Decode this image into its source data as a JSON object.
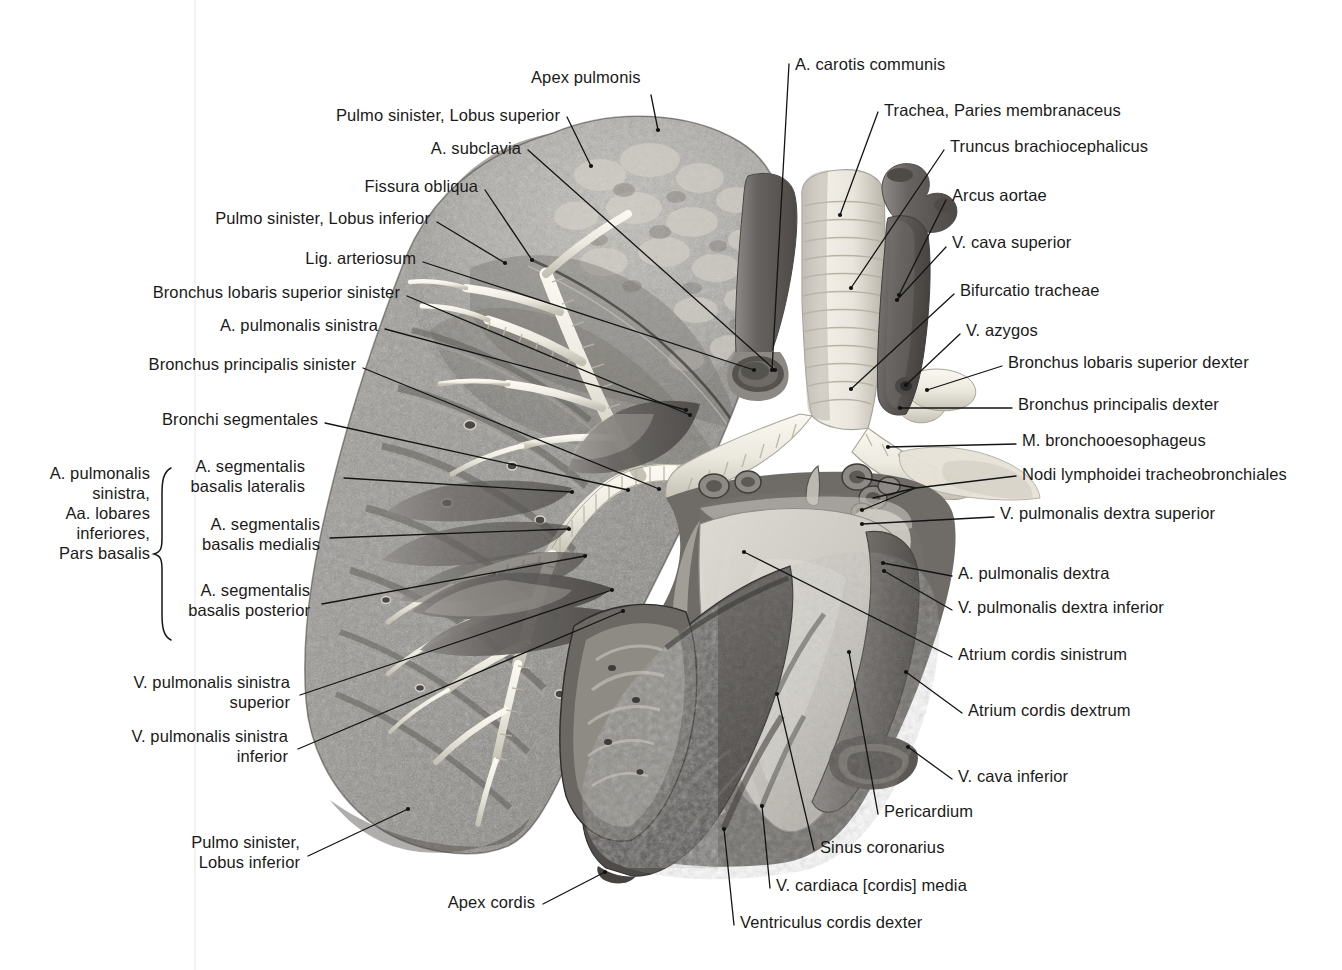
{
  "figure": {
    "type": "anatomical-photograph",
    "orientation": "medial view of left lung with heart and great vessels"
  },
  "colors": {
    "background": "#ffffff",
    "text": "#1a1a1a",
    "leader_line": "#141414",
    "gutter": "#f2f2f4",
    "lung_light": "#b9b6b0",
    "lung_mid": "#8e8b86",
    "lung_dark": "#5e5b57",
    "bronchus_white": "#efece4",
    "vessel_dark": "#6d6a68",
    "atrium_light": "#cfccc6",
    "myocardium": "#5a5754"
  },
  "labels": {
    "left": [
      {
        "id": "pulmo-sinister-lobus-superior",
        "text": "Pulmo sinister, Lobus superior",
        "x": 560,
        "y": 115,
        "align": "right",
        "lines": 1
      },
      {
        "id": "a-subclavia",
        "text": "A. subclavia",
        "x": 521,
        "y": 148,
        "align": "right",
        "lines": 1
      },
      {
        "id": "fissura-obliqua",
        "text": "Fissura obliqua",
        "x": 478,
        "y": 186,
        "align": "right",
        "lines": 1
      },
      {
        "id": "pulmo-sinister-lobus-inferior-top",
        "text": "Pulmo sinister, Lobus inferior",
        "x": 430,
        "y": 218,
        "align": "right",
        "lines": 1
      },
      {
        "id": "lig-arteriosum",
        "text": "Lig. arteriosum",
        "x": 416,
        "y": 258,
        "align": "right",
        "lines": 1
      },
      {
        "id": "bronchus-lobaris-superior-sinister",
        "text": "Bronchus lobaris superior sinister",
        "x": 400,
        "y": 292,
        "align": "right",
        "lines": 1
      },
      {
        "id": "a-pulmonalis-sinistra",
        "text": "A. pulmonalis sinistra",
        "x": 378,
        "y": 325,
        "align": "right",
        "lines": 1
      },
      {
        "id": "bronchus-principalis-sinister",
        "text": "Bronchus principalis sinister",
        "x": 356,
        "y": 364,
        "align": "right",
        "lines": 1
      },
      {
        "id": "bronchi-segmentales",
        "text": "Bronchi segmentales",
        "x": 318,
        "y": 419,
        "align": "right",
        "lines": 1
      },
      {
        "id": "a-segmentalis-basalis-lateralis",
        "text": "A. segmentalis\nbasalis lateralis",
        "x": 305,
        "y": 476,
        "align": "right",
        "lines": 2
      },
      {
        "id": "a-segmentalis-basalis-medialis",
        "text": "A. segmentalis\nbasalis medialis",
        "x": 320,
        "y": 534,
        "align": "right",
        "lines": 2
      },
      {
        "id": "a-segmentalis-basalis-posterior",
        "text": "A. segmentalis\nbasalis posterior",
        "x": 310,
        "y": 600,
        "align": "right",
        "lines": 2
      },
      {
        "id": "v-pulmonalis-sinistra-superior",
        "text": "V. pulmonalis sinistra\nsuperior",
        "x": 290,
        "y": 692,
        "align": "right",
        "lines": 2
      },
      {
        "id": "v-pulmonalis-sinistra-inferior",
        "text": "V. pulmonalis sinistra\ninferior",
        "x": 288,
        "y": 746,
        "align": "right",
        "lines": 2
      },
      {
        "id": "pulmo-sinister-lobus-inferior-bottom",
        "text": "Pulmo sinister,\nLobus inferior",
        "x": 300,
        "y": 852,
        "align": "right",
        "lines": 2
      }
    ],
    "brace_group": {
      "id": "a-pulmonalis-sinistra-group",
      "text": "A. pulmonalis\nsinistra,\nAa. lobares\ninferiores,\nPars basalis",
      "x": 150,
      "y": 513,
      "align": "right",
      "lines": 5,
      "brace": {
        "x": 160,
        "top": 468,
        "bottom": 640
      }
    },
    "right": [
      {
        "id": "a-carotis-communis",
        "text": "A. carotis communis",
        "x": 795,
        "y": 64,
        "align": "left",
        "lines": 1
      },
      {
        "id": "trachea-paries-membranaceus",
        "text": "Trachea, Paries membranaceus",
        "x": 884,
        "y": 110,
        "align": "left",
        "lines": 1
      },
      {
        "id": "truncus-brachiocephalicus",
        "text": "Truncus brachiocephalicus",
        "x": 950,
        "y": 146,
        "align": "left",
        "lines": 1
      },
      {
        "id": "arcus-aortae",
        "text": "Arcus aortae",
        "x": 952,
        "y": 195,
        "align": "left",
        "lines": 1
      },
      {
        "id": "v-cava-superior",
        "text": "V. cava superior",
        "x": 952,
        "y": 242,
        "align": "left",
        "lines": 1
      },
      {
        "id": "bifurcatio-tracheae",
        "text": "Bifurcatio tracheae",
        "x": 960,
        "y": 290,
        "align": "left",
        "lines": 1
      },
      {
        "id": "v-azygos",
        "text": "V. azygos",
        "x": 966,
        "y": 330,
        "align": "left",
        "lines": 1
      },
      {
        "id": "bronchus-lobaris-superior-dexter",
        "text": "Bronchus lobaris superior dexter",
        "x": 1008,
        "y": 362,
        "align": "left",
        "lines": 1
      },
      {
        "id": "bronchus-principalis-dexter",
        "text": "Bronchus principalis dexter",
        "x": 1018,
        "y": 404,
        "align": "left",
        "lines": 1
      },
      {
        "id": "m-bronchooesophageus",
        "text": "M. bronchooesophageus",
        "x": 1022,
        "y": 440,
        "align": "left",
        "lines": 1
      },
      {
        "id": "nodi-lymphoidei-tracheobronchiales",
        "text": "Nodi lymphoidei tracheobronchiales",
        "x": 1022,
        "y": 474,
        "align": "left",
        "lines": 1
      },
      {
        "id": "v-pulmonalis-dextra-superior",
        "text": "V. pulmonalis dextra superior",
        "x": 1000,
        "y": 513,
        "align": "left",
        "lines": 1
      },
      {
        "id": "a-pulmonalis-dextra",
        "text": "A. pulmonalis dextra",
        "x": 958,
        "y": 573,
        "align": "left",
        "lines": 1
      },
      {
        "id": "v-pulmonalis-dextra-inferior",
        "text": "V. pulmonalis dextra inferior",
        "x": 958,
        "y": 607,
        "align": "left",
        "lines": 1
      },
      {
        "id": "atrium-cordis-sinistrum",
        "text": "Atrium cordis sinistrum",
        "x": 958,
        "y": 654,
        "align": "left",
        "lines": 1
      },
      {
        "id": "atrium-cordis-dextrum",
        "text": "Atrium cordis dextrum",
        "x": 968,
        "y": 710,
        "align": "left",
        "lines": 1
      },
      {
        "id": "v-cava-inferior",
        "text": "V. cava inferior",
        "x": 958,
        "y": 776,
        "align": "left",
        "lines": 1
      },
      {
        "id": "pericardium",
        "text": "Pericardium",
        "x": 884,
        "y": 811,
        "align": "left",
        "lines": 1
      },
      {
        "id": "sinus-coronarius",
        "text": "Sinus coronarius",
        "x": 820,
        "y": 847,
        "align": "left",
        "lines": 1
      },
      {
        "id": "v-cardiaca-cordis-media",
        "text": "V. cardiaca [cordis] media",
        "x": 776,
        "y": 885,
        "align": "left",
        "lines": 1
      },
      {
        "id": "ventriculus-cordis-dexter",
        "text": "Ventriculus cordis dexter",
        "x": 740,
        "y": 922,
        "align": "left",
        "lines": 1
      }
    ],
    "top": [
      {
        "id": "apex-pulmonis",
        "text": "Apex pulmonis",
        "x": 531,
        "y": 77,
        "align": "left",
        "lines": 1
      }
    ],
    "bottom": [
      {
        "id": "apex-cordis",
        "text": "Apex cordis",
        "x": 535,
        "y": 902,
        "align": "right",
        "lines": 1
      }
    ]
  },
  "leaders": [
    {
      "for": "apex-pulmonis",
      "d": "M 651,95 L 658,130"
    },
    {
      "for": "a-carotis-communis",
      "d": "M 789,64 L 772,370"
    },
    {
      "for": "pulmo-sinister-lobus-superior",
      "d": "M 567,117 L 591,166"
    },
    {
      "for": "trachea-paries-membranaceus",
      "d": "M 878,112 L 840,215"
    },
    {
      "for": "truncus-brachiocephalicus",
      "d": "M 944,150 L 851,288"
    },
    {
      "for": "a-subclavia",
      "d": "M 528,150 L 775,370"
    },
    {
      "for": "arcus-aortae",
      "d": "M 946,200 L 899,295"
    },
    {
      "for": "fissura-obliqua",
      "d": "M 485,190 L 532,260"
    },
    {
      "for": "pulmo-sinister-lobus-inferior-top",
      "d": "M 437,222 L 505,263"
    },
    {
      "for": "v-cava-superior",
      "d": "M 946,247 L 897,300"
    },
    {
      "for": "bifurcatio-tracheae",
      "d": "M 954,294 L 851,389"
    },
    {
      "for": "lig-arteriosum",
      "d": "M 423,262 L 754,370"
    },
    {
      "for": "bronchus-lobaris-superior-sinister",
      "d": "M 407,296 L 690,415"
    },
    {
      "for": "v-azygos",
      "d": "M 960,334 L 906,385"
    },
    {
      "for": "a-pulmonalis-sinistra",
      "d": "M 385,329 L 686,410"
    },
    {
      "for": "bronchus-lobaris-superior-dexter",
      "d": "M 1002,366 L 927,390"
    },
    {
      "for": "bronchus-principalis-sinister",
      "d": "M 363,368 L 659,489"
    },
    {
      "for": "bronchus-principalis-dexter",
      "d": "M 1012,408 L 900,408"
    },
    {
      "for": "bronchi-segmentales",
      "d": "M 325,423 L 628,490"
    },
    {
      "for": "m-bronchooesophageus",
      "d": "M 1016,444 L 888,447"
    },
    {
      "for": "nodi-lymphoidei-tracheobronchiales",
      "d": "M 1016,476 L 916,488 M 916,488 L 857,477 M 916,488 L 873,498 M 916,488 L 862,510"
    },
    {
      "for": "a-segmentalis-basalis-lateralis",
      "d": "M 344,478 L 572,492"
    },
    {
      "for": "v-pulmonalis-dextra-superior",
      "d": "M 994,517 L 862,524"
    },
    {
      "for": "a-segmentalis-basalis-medialis",
      "d": "M 330,538 L 569,529"
    },
    {
      "for": "a-pulmonalis-dextra",
      "d": "M 952,576 L 883,563"
    },
    {
      "for": "v-pulmonalis-dextra-inferior",
      "d": "M 952,610 L 884,571"
    },
    {
      "for": "a-segmentalis-basalis-posterior",
      "d": "M 322,604 L 585,556"
    },
    {
      "for": "atrium-cordis-sinistrum",
      "d": "M 952,657 L 744,552"
    },
    {
      "for": "atrium-cordis-dextrum",
      "d": "M 962,713 L 906,672"
    },
    {
      "for": "v-pulmonalis-sinistra-superior",
      "d": "M 300,695 L 612,590"
    },
    {
      "for": "v-pulmonalis-sinistra-inferior",
      "d": "M 298,749 L 623,611"
    },
    {
      "for": "v-cava-inferior",
      "d": "M 952,779 L 908,747"
    },
    {
      "for": "pericardium",
      "d": "M 878,814 L 849,652"
    },
    {
      "for": "sinus-coronarius",
      "d": "M 814,850 L 777,694"
    },
    {
      "for": "pulmo-sinister-lobus-inferior-bottom",
      "d": "M 308,856 L 408,809"
    },
    {
      "for": "v-cardiaca-cordis-media",
      "d": "M 770,888 L 762,806"
    },
    {
      "for": "apex-cordis",
      "d": "M 543,904 L 605,872"
    },
    {
      "for": "ventriculus-cordis-dexter",
      "d": "M 734,925 L 724,829"
    }
  ]
}
